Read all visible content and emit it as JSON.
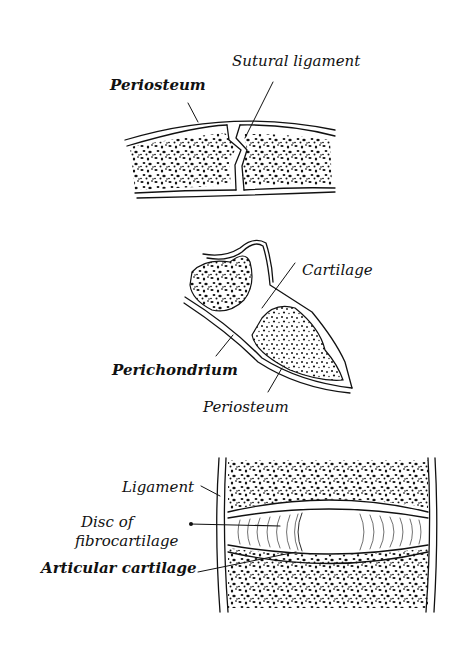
{
  "figures": [
    {
      "id": "suture",
      "labels": {
        "periosteum": "Periosteum",
        "sutural_ligament": "Sutural ligament"
      }
    },
    {
      "id": "synchondrosis",
      "labels": {
        "cartilage": "Cartilage",
        "perichondrium": "Perichondrium",
        "periosteum": "Periosteum"
      }
    },
    {
      "id": "symphysis",
      "labels": {
        "ligament": "Ligament",
        "disc_line1": "Disc of",
        "disc_line2": "fibrocartilage",
        "articular_cartilage": "Articular cartilage"
      }
    }
  ],
  "colors": {
    "ink": "#111111",
    "paper": "#ffffff"
  }
}
